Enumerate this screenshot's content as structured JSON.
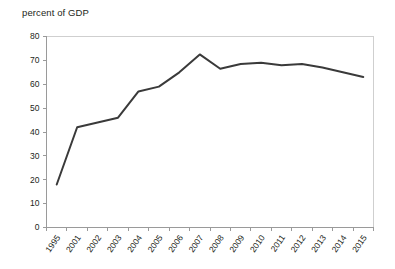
{
  "chart_data": {
    "type": "line",
    "title": "percent of GDP",
    "xlabel": "",
    "ylabel": "",
    "ylim": [
      0,
      80
    ],
    "yticks": [
      0,
      10,
      20,
      30,
      40,
      50,
      60,
      70,
      80
    ],
    "grid": false,
    "legend": null,
    "legend_position": "none",
    "line_color": "#3a3a3a",
    "axis_color": "#9a9a9a",
    "frame_color": "#cfcfcf",
    "text_color": "#231f20",
    "categories": [
      "1995",
      "2001",
      "2002",
      "2003",
      "2004",
      "2005",
      "2006",
      "2007",
      "2008",
      "2009",
      "2010",
      "2011",
      "2012",
      "2013",
      "2014",
      "2015"
    ],
    "values": [
      18,
      42,
      44,
      46,
      57,
      59,
      65,
      72.5,
      66.5,
      68.5,
      69,
      68,
      68.5,
      67,
      65,
      63
    ],
    "series": [
      {
        "name": "percent of GDP",
        "values": [
          18,
          42,
          44,
          46,
          57,
          59,
          65,
          72.5,
          66.5,
          68.5,
          69,
          68,
          68.5,
          67,
          65,
          63
        ]
      }
    ]
  }
}
